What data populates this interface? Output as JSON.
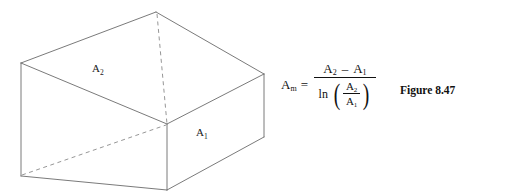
{
  "figure": {
    "caption": "Figure 8.47",
    "diagram": {
      "name": "truncated-prism-wedge",
      "line_color": "#6b6b6b",
      "dashed_line_color": "#8a8a8a",
      "labels": {
        "area_top": {
          "base": "A",
          "sub": "2"
        },
        "area_front": {
          "base": "A",
          "sub": "1"
        }
      },
      "vertices": {
        "apex_top": [
          156,
          12
        ],
        "left_top": [
          21,
          63
        ],
        "right_top": [
          264,
          74
        ],
        "center_junction": [
          167,
          124
        ],
        "left_bottom": [
          21,
          176
        ],
        "center_bottom": [
          167,
          190
        ],
        "right_bottom": [
          264,
          137
        ]
      }
    }
  },
  "equation": {
    "lhs": {
      "base": "A",
      "sub": "m"
    },
    "equals": "=",
    "numerator": {
      "left": {
        "base": "A",
        "sub": "2"
      },
      "operator": "–",
      "right": {
        "base": "A",
        "sub": "1"
      }
    },
    "denominator": {
      "function": "ln",
      "paren_open": "(",
      "paren_close": ")",
      "inner_numerator": {
        "base": "A",
        "sub": "2"
      },
      "inner_denominator": {
        "base": "A",
        "sub": "1"
      }
    }
  }
}
